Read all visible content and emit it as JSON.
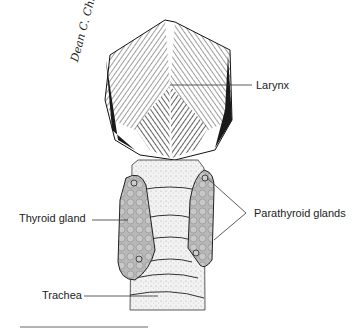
{
  "figure": {
    "type": "anatomical illustration",
    "labels": {
      "larynx": "Larynx",
      "thyroid": "Thyroid gland",
      "parathyroid": "Parathyroid glands",
      "trachea": "Trachea"
    },
    "signature": "Dean C. Christian"
  }
}
